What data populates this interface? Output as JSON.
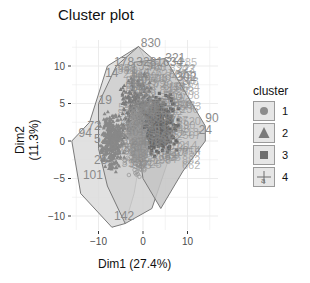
{
  "chart_data": {
    "type": "scatter",
    "title": "Cluster plot",
    "xlabel": "Dim1 (27.4%)",
    "ylabel": "Dim2 (11.3%)",
    "xlim": [
      -16,
      17
    ],
    "ylim": [
      -12,
      13
    ],
    "x_ticks": [
      -10,
      0,
      10
    ],
    "y_ticks": [
      -10,
      -5,
      0,
      5,
      10
    ],
    "grid": true,
    "legend": {
      "title": "cluster",
      "position": "right",
      "entries": [
        {
          "label": "1",
          "shape": "circle"
        },
        {
          "label": "2",
          "shape": "triangle"
        },
        {
          "label": "3",
          "shape": "square"
        },
        {
          "label": "4",
          "shape": "cross-dot"
        }
      ]
    },
    "colors": {
      "background": "#ffffff",
      "grid": "#ebebeb",
      "hull_fill": "#d9d9d9",
      "points_dark": "#6e6e6e",
      "points_mid": "#8c8c8c",
      "labels": "#8a8a8a"
    },
    "annotated_points": [
      {
        "label": "830",
        "x": -0.5,
        "y": 12.5,
        "cluster": "2"
      },
      {
        "label": "178",
        "x": -6.5,
        "y": 10.0,
        "cluster": "1"
      },
      {
        "label": "328",
        "x": -1.5,
        "y": 10.0,
        "cluster": "1"
      },
      {
        "label": "1634",
        "x": 3.0,
        "y": 10.0,
        "cluster": "3"
      },
      {
        "label": "321",
        "x": 5.0,
        "y": 10.6,
        "cluster": "3"
      },
      {
        "label": "302",
        "x": 7.5,
        "y": 8.0,
        "cluster": "3"
      },
      {
        "label": "14",
        "x": -8.5,
        "y": 8.5,
        "cluster": "2"
      },
      {
        "label": "19",
        "x": -10.0,
        "y": 5.0,
        "cluster": "2"
      },
      {
        "label": "72",
        "x": -12.5,
        "y": 1.5,
        "cluster": "2"
      },
      {
        "label": "94",
        "x": -14.5,
        "y": 0.5,
        "cluster": "2"
      },
      {
        "label": "52",
        "x": -11.0,
        "y": -0.3,
        "cluster": "2"
      },
      {
        "label": "78",
        "x": -9.0,
        "y": -1.0,
        "cluster": "2"
      },
      {
        "label": "25",
        "x": -11.0,
        "y": -3.0,
        "cluster": "2"
      },
      {
        "label": "101",
        "x": -13.5,
        "y": -5.0,
        "cluster": "2"
      },
      {
        "label": "142",
        "x": -6.5,
        "y": -10.5,
        "cluster": "2"
      },
      {
        "label": "90",
        "x": 14.0,
        "y": 2.5,
        "cluster": "3"
      },
      {
        "label": "24",
        "x": 12.5,
        "y": 1.0,
        "cluster": "3"
      }
    ],
    "hulls": [
      {
        "cluster": "2",
        "points": [
          [
            -16,
            0
          ],
          [
            -12,
            2.5
          ],
          [
            -8,
            10
          ],
          [
            -1,
            12.6
          ],
          [
            2,
            9
          ],
          [
            0,
            0
          ],
          [
            -2,
            -7
          ],
          [
            -4,
            -11
          ],
          [
            -7,
            -11.5
          ],
          [
            -14,
            -7
          ]
        ]
      },
      {
        "cluster": "1",
        "points": [
          [
            -10,
            5
          ],
          [
            -6,
            10
          ],
          [
            -1,
            12.6
          ],
          [
            4,
            10
          ],
          [
            6,
            6
          ],
          [
            6,
            -2
          ],
          [
            2,
            -9
          ],
          [
            -4,
            -11
          ],
          [
            -8,
            -6
          ],
          [
            -10,
            -1
          ]
        ]
      },
      {
        "cluster": "3",
        "points": [
          [
            -2,
            10.5
          ],
          [
            5,
            11
          ],
          [
            8,
            8
          ],
          [
            14,
            2
          ],
          [
            14,
            0
          ],
          [
            9,
            -4
          ],
          [
            4,
            -9
          ],
          [
            0,
            -5
          ],
          [
            -2,
            3
          ]
        ]
      }
    ]
  }
}
